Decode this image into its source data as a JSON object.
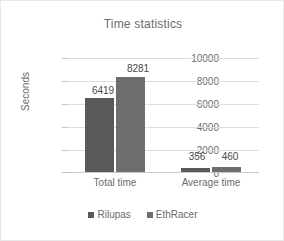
{
  "chart_data": {
    "type": "bar",
    "title": "Time statistics",
    "xlabel": "",
    "ylabel": "Seconds",
    "categories": [
      "Total time",
      "Average time"
    ],
    "series": [
      {
        "name": "Rilupas",
        "color": "#595959",
        "values": [
          6419,
          356
        ]
      },
      {
        "name": "EthRacer",
        "color": "#6e6e6e",
        "values": [
          8281,
          460
        ]
      }
    ],
    "ylim": [
      0,
      10000
    ],
    "yticks": [
      0,
      2000,
      4000,
      6000,
      8000,
      10000
    ],
    "ytick_labels": [
      "0",
      "2000",
      "4000",
      "6000",
      "8000",
      "10000"
    ],
    "data_labels": [
      "6419",
      "8281",
      "356",
      "460"
    ],
    "grid": "horizontal",
    "legend_position": "bottom"
  },
  "axis": {
    "y_title": "Seconds",
    "y_labels": {
      "t0": "0",
      "t2000": "2000",
      "t4000": "4000",
      "t6000": "6000",
      "t8000": "8000",
      "t10000": "10000"
    }
  },
  "categories": {
    "c0": "Total time",
    "c1": "Average time"
  },
  "labels": {
    "l0": "6419",
    "l1": "8281",
    "l2": "356",
    "l3": "460"
  },
  "legend": {
    "items": [
      {
        "label": "Rilupas"
      },
      {
        "label": "EthRacer"
      }
    ]
  }
}
